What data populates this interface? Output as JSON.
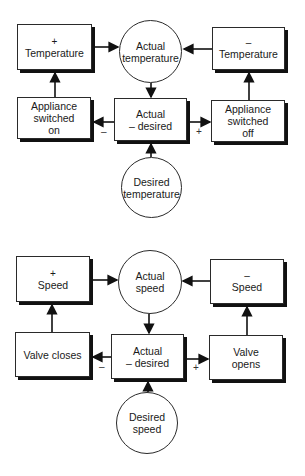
{
  "diagrams": [
    {
      "name": "temperature-control",
      "nodes": {
        "increase": {
          "sign": "+",
          "label": "Temperature"
        },
        "actual": {
          "line1": "Actual",
          "line2": "temperature"
        },
        "decrease": {
          "sign": "–",
          "label": "Temperature"
        },
        "on_action": {
          "line1": "Appliance",
          "line2": "switched",
          "line3": "on"
        },
        "comparator": {
          "line1": "Actual",
          "line2": "– desired"
        },
        "off_action": {
          "line1": "Appliance",
          "line2": "switched",
          "line3": "off"
        },
        "desired": {
          "line1": "Desired",
          "line2": "temperature"
        }
      },
      "edge_labels": {
        "negative": "–",
        "positive": "+"
      }
    },
    {
      "name": "speed-control",
      "nodes": {
        "increase": {
          "sign": "+",
          "label": "Speed"
        },
        "actual": {
          "line1": "Actual",
          "line2": "speed"
        },
        "decrease": {
          "sign": "–",
          "label": "Speed"
        },
        "on_action": {
          "line1": "Valve closes"
        },
        "comparator": {
          "line1": "Actual",
          "line2": "– desired"
        },
        "off_action": {
          "line1": "Valve",
          "line2": "opens"
        },
        "desired": {
          "line1": "Desired",
          "line2": "speed"
        }
      },
      "edge_labels": {
        "negative": "–",
        "positive": "+"
      }
    }
  ]
}
